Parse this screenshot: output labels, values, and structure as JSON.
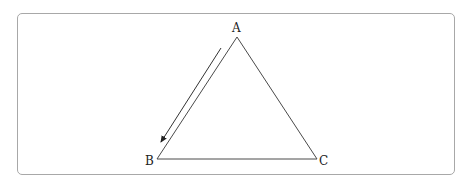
{
  "diagram": {
    "type": "triangle",
    "vertices": [
      {
        "label": "A",
        "x": 237,
        "y": 37
      },
      {
        "label": "B",
        "x": 157,
        "y": 159
      },
      {
        "label": "C",
        "x": 317,
        "y": 159
      }
    ],
    "arrow": {
      "from": "A",
      "to": "B",
      "alongside_side": "AB"
    },
    "colors": {
      "stroke": "#4a4a4a",
      "border": "#a8a8a8"
    }
  },
  "labels": {
    "a": "A",
    "b": "B",
    "c": "C"
  }
}
